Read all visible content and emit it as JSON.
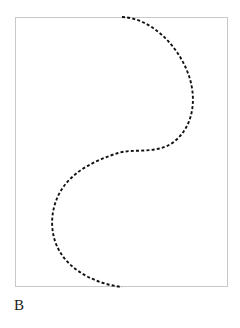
{
  "figure": {
    "panel_label": "B",
    "background_color": "#ffffff",
    "frame": {
      "name": "plot-frame",
      "x": 15,
      "y": 17,
      "width": 213,
      "height": 270,
      "stroke_color": "#c8c8c8",
      "stroke_width": 1,
      "fill": "none"
    },
    "curve": {
      "name": "dashed-s-curve",
      "stroke_color": "#111111",
      "stroke_width": 1.9,
      "dash_length": 3,
      "gap_length": 2.2,
      "linecap": "butt",
      "path": "M 122 17 C 150 18 178 44 189 76 C 197 100 193 126 175 141 C 158 155 134 148 118 153 C 96 160 76 170 64 186 C 50 205 48 232 60 252 C 72 272 97 284 122 287"
    }
  },
  "chart_data": {
    "type": "line",
    "title": "",
    "xlabel": "",
    "ylabel": "",
    "grid": false,
    "legend": "none",
    "series": [
      {
        "name": "dashed-s-curve",
        "style": "dashed",
        "color": "#111111",
        "points": [
          [
            122,
            17
          ],
          [
            132,
            19
          ],
          [
            145,
            24
          ],
          [
            158,
            33
          ],
          [
            170,
            46
          ],
          [
            180,
            62
          ],
          [
            187,
            79
          ],
          [
            190,
            95
          ],
          [
            189,
            110
          ],
          [
            184,
            124
          ],
          [
            175,
            135
          ],
          [
            164,
            144
          ],
          [
            151,
            149
          ],
          [
            137,
            152
          ],
          [
            122,
            154
          ],
          [
            108,
            158
          ],
          [
            94,
            164
          ],
          [
            81,
            172
          ],
          [
            70,
            182
          ],
          [
            61,
            194
          ],
          [
            55,
            208
          ],
          [
            53,
            222
          ],
          [
            56,
            238
          ],
          [
            63,
            253
          ],
          [
            74,
            266
          ],
          [
            88,
            277
          ],
          [
            104,
            284
          ],
          [
            122,
            287
          ]
        ]
      }
    ],
    "xlim": [
      15,
      228
    ],
    "ylim": [
      17,
      287
    ]
  }
}
